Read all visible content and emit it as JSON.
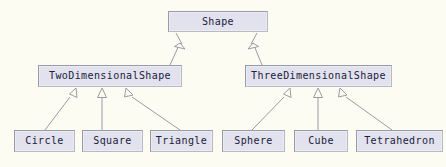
{
  "diagram": {
    "type": "uml-class-inheritance",
    "background_color": "#fdfcf2",
    "node_fill_color": "#e2e2ee",
    "node_border_color": "#9a9aa6",
    "node_text_color": "#20203c",
    "edge_color": "#9a9aa6",
    "relationship_type": "generalization",
    "arrowhead": "hollow-triangle",
    "nodes": [
      {
        "id": "shape",
        "label": "Shape",
        "level": "root",
        "x": 168,
        "y": 11,
        "w": 100,
        "h": 21
      },
      {
        "id": "two_d",
        "label": "TwoDimensionalShape",
        "level": "mid",
        "x": 38,
        "y": 65,
        "w": 144,
        "h": 22
      },
      {
        "id": "three_d",
        "label": "ThreeDimensionalShape",
        "level": "mid",
        "x": 245,
        "y": 65,
        "w": 147,
        "h": 22
      },
      {
        "id": "circle",
        "label": "Circle",
        "level": "leaf",
        "x": 14,
        "y": 130,
        "w": 61,
        "h": 22
      },
      {
        "id": "square",
        "label": "Square",
        "level": "leaf",
        "x": 82,
        "y": 130,
        "w": 61,
        "h": 22
      },
      {
        "id": "triangle",
        "label": "Triangle",
        "level": "leaf",
        "x": 150,
        "y": 130,
        "w": 63,
        "h": 22
      },
      {
        "id": "sphere",
        "label": "Sphere",
        "level": "leaf",
        "x": 222,
        "y": 130,
        "w": 63,
        "h": 22
      },
      {
        "id": "cube",
        "label": "Cube",
        "level": "leaf",
        "x": 294,
        "y": 130,
        "w": 54,
        "h": 22
      },
      {
        "id": "tetrahedron",
        "label": "Tetrahedron",
        "level": "leaf",
        "x": 356,
        "y": 130,
        "w": 87,
        "h": 22
      }
    ],
    "edges": [
      {
        "from": "two_d",
        "to": "shape",
        "label": ""
      },
      {
        "from": "three_d",
        "to": "shape",
        "label": ""
      },
      {
        "from": "circle",
        "to": "two_d",
        "label": ""
      },
      {
        "from": "square",
        "to": "two_d",
        "label": ""
      },
      {
        "from": "triangle",
        "to": "two_d",
        "label": ""
      },
      {
        "from": "sphere",
        "to": "three_d",
        "label": ""
      },
      {
        "from": "cube",
        "to": "three_d",
        "label": ""
      },
      {
        "from": "tetrahedron",
        "to": "three_d",
        "label": ""
      }
    ]
  }
}
